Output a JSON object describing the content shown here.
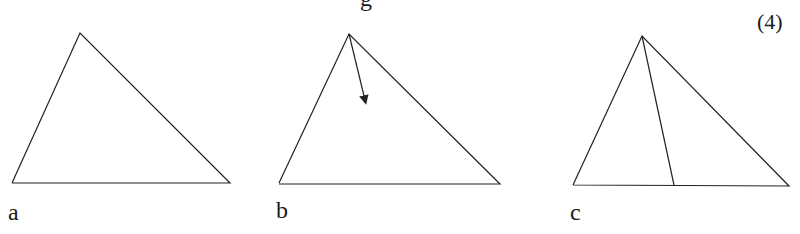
{
  "header": {
    "clipped_text": "g",
    "marks": "(4)"
  },
  "figures": [
    {
      "label": "a",
      "description": "triangle"
    },
    {
      "label": "b",
      "description": "triangle with arrow from apex pointing into interior"
    },
    {
      "label": "c",
      "description": "triangle with line from apex to base"
    }
  ],
  "colors": {
    "stroke": "#222222",
    "background": "#ffffff"
  }
}
